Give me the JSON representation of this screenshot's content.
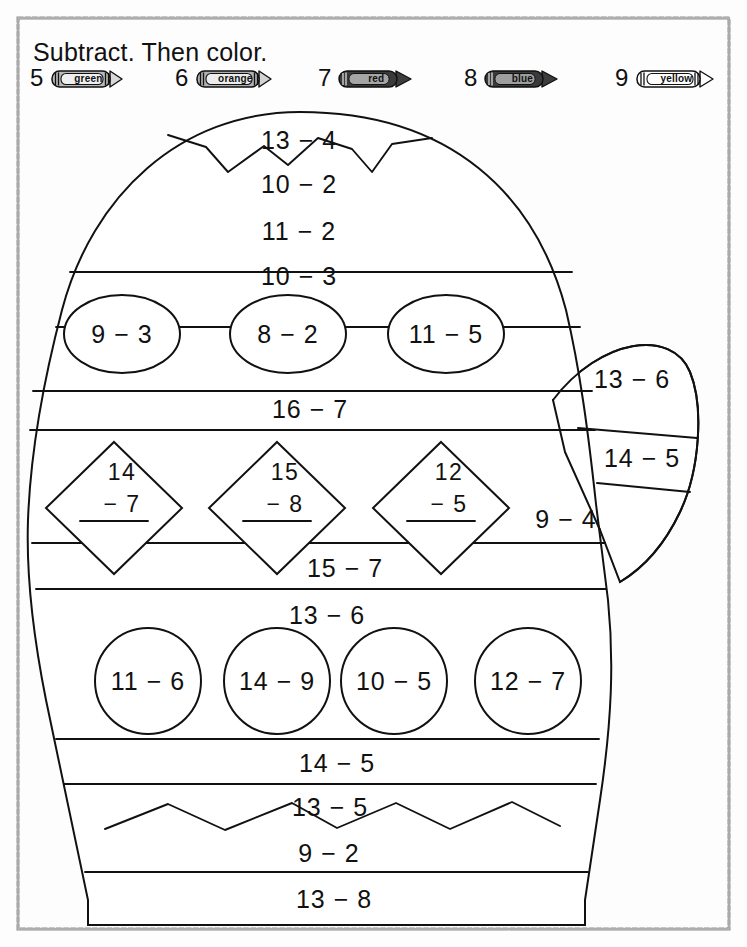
{
  "worksheet": {
    "title": "Subtract. Then color.",
    "color_key": [
      {
        "number": "5",
        "color_word": "green",
        "swatch": "#b9b9b9"
      },
      {
        "number": "6",
        "color_word": "orange",
        "swatch": "#b0b0b0"
      },
      {
        "number": "7",
        "color_word": "red",
        "swatch": "#9a9a9a"
      },
      {
        "number": "8",
        "color_word": "blue",
        "swatch": "#8e8e8e"
      },
      {
        "number": "9",
        "color_word": "yellow",
        "swatch": "#fdfdfd"
      }
    ]
  },
  "problems": {
    "band_13_4": "13 − 4",
    "band_10_2": "10 − 2",
    "band_11_2": "11 − 2",
    "band_10_3": "10 − 3",
    "ellipse_1": "9 − 3",
    "ellipse_2": "8 − 2",
    "ellipse_3": "11 − 5",
    "band_16_7": "16 − 7",
    "diamond_1_top": "14",
    "diamond_1_bot": "− 7",
    "diamond_2_top": "15",
    "diamond_2_bot": "− 8",
    "diamond_3_top": "12",
    "diamond_3_bot": "− 5",
    "thumb_13_6": "13 − 6",
    "thumb_14_5": "14 − 5",
    "thumb_9_4": "9 − 4",
    "band_15_7": "15 − 7",
    "band_13_6": "13 − 6",
    "circle_1": "11 − 6",
    "circle_2": "14 − 9",
    "circle_3": "10 − 5",
    "circle_4": "12 − 7",
    "band_14_5": "14 − 5",
    "band_13_5": "13 − 5",
    "band_9_2": "9 − 2",
    "band_13_8": "13 − 8"
  }
}
